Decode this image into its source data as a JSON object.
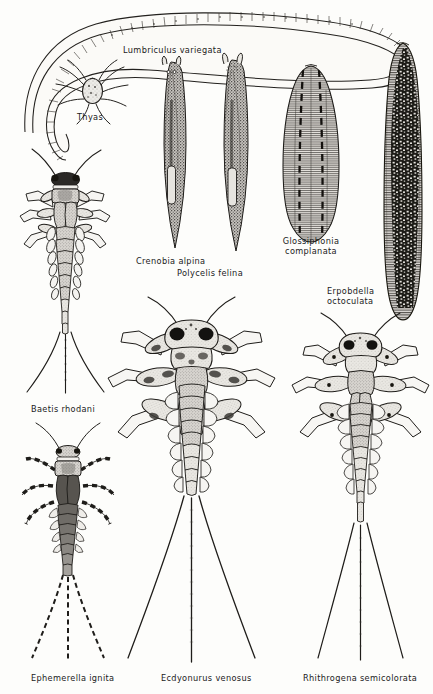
{
  "plate": {
    "title": "Freshwater invertebrate illustration plate",
    "background_color": "#fdfdfb",
    "ink_color": "#1b1b1b",
    "width": 433,
    "height": 694
  },
  "labels": {
    "lumbriculus": "Lumbriculus variegata",
    "thyas": "Thyas",
    "crenobia": "Crenobia alpina",
    "polycelis": "Polycelis felina",
    "glossiphonia_line1": "Glossiphonia",
    "glossiphonia_line2": "complanata",
    "erpobdella_line1": "Erpobdella",
    "erpobdella_line2": "octoculata",
    "baetis": "Baetis  rhodani",
    "ephemerella": "Ephemerella  ignita",
    "ecdyonurus": "Ecdyonurus  venosus",
    "rhithrogena": "Rhithrogena  semicolorata"
  },
  "specimens": [
    {
      "name": "lumbriculus-variegata",
      "common": "segmented aquatic worm",
      "group": "Oligochaeta"
    },
    {
      "name": "thyas",
      "common": "water mite",
      "group": "Hydracarina"
    },
    {
      "name": "crenobia-alpina",
      "common": "alpine flatworm",
      "group": "Turbellaria"
    },
    {
      "name": "polycelis-felina",
      "common": "flatworm",
      "group": "Turbellaria"
    },
    {
      "name": "glossiphonia-complanata",
      "common": "flat leech",
      "group": "Hirudinea"
    },
    {
      "name": "erpobdella-octoculata",
      "common": "worm leech",
      "group": "Hirudinea"
    },
    {
      "name": "baetis-rhodani",
      "common": "olive mayfly nymph",
      "group": "Ephemeroptera"
    },
    {
      "name": "ephemerella-ignita",
      "common": "blue-winged olive nymph",
      "group": "Ephemeroptera"
    },
    {
      "name": "ecdyonurus-venosus",
      "common": "flat mayfly nymph",
      "group": "Ephemeroptera"
    },
    {
      "name": "rhithrogena-semicolorata",
      "common": "march brown nymph",
      "group": "Ephemeroptera"
    }
  ]
}
